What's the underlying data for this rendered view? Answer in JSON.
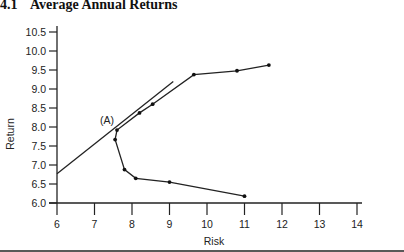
{
  "section": {
    "number": "4.1",
    "title": "Average Annual Returns"
  },
  "chart_data": {
    "type": "line",
    "title": "Average Annual Returns",
    "xlabel": "Risk",
    "ylabel": "Return",
    "xlim": [
      6,
      14
    ],
    "ylim": [
      6.0,
      10.5
    ],
    "x_ticks": [
      "6",
      "7",
      "8",
      "9",
      "10",
      "11",
      "12",
      "13",
      "14"
    ],
    "y_ticks": [
      "6.0",
      "6.5",
      "7.0",
      "7.5",
      "8.0",
      "8.5",
      "9.0",
      "9.5",
      "10.0",
      "10.5"
    ],
    "grid": false,
    "legend": null,
    "series": [
      {
        "name": "Efficient frontier",
        "markers": true,
        "points": [
          {
            "x": 11.0,
            "y": 6.18
          },
          {
            "x": 9.0,
            "y": 6.55
          },
          {
            "x": 8.1,
            "y": 6.65
          },
          {
            "x": 7.8,
            "y": 6.88
          },
          {
            "x": 7.55,
            "y": 7.67
          },
          {
            "x": 7.6,
            "y": 7.92
          },
          {
            "x": 8.2,
            "y": 8.37
          },
          {
            "x": 8.55,
            "y": 8.6
          },
          {
            "x": 9.65,
            "y": 9.38
          },
          {
            "x": 10.8,
            "y": 9.48
          },
          {
            "x": 11.65,
            "y": 9.63
          }
        ]
      },
      {
        "name": "Tangent line",
        "markers": false,
        "points": [
          {
            "x": 6.0,
            "y": 6.77
          },
          {
            "x": 9.1,
            "y": 9.2
          }
        ]
      }
    ],
    "annotations": [
      {
        "text": "(A)",
        "x": 7.6,
        "y": 7.92
      }
    ]
  }
}
